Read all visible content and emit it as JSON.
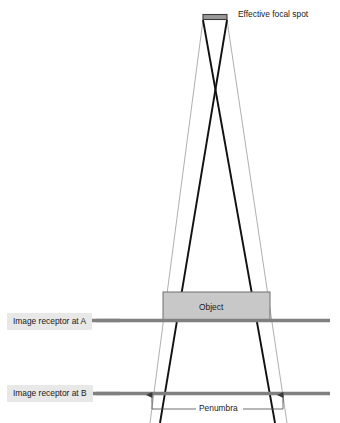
{
  "figure": {
    "labels": {
      "focal_spot": "Effective focal spot",
      "object": "Object",
      "penumbra": "Penumbra",
      "receptor_a": "Image receptor at A",
      "receptor_b": "Image receptor at B"
    },
    "colors": {
      "background": "#ffffff",
      "beam_outer": "#111111",
      "beam_inner": "#9a9a9a",
      "receptor_line": "#808080",
      "object_fill": "#c8c8c8",
      "object_stroke": "#6e6e6e",
      "focal_spot_fill": "#9a9a9a",
      "focal_spot_stroke": "#3a3a3a",
      "label_box": "#e8e8e8",
      "text": "#1a1a1a",
      "annotation": "#4a4a4a"
    },
    "geometry": {
      "focal_spot": {
        "x1": 203,
        "x2": 227,
        "y": 15,
        "height": 5
      },
      "beams": [
        {
          "name": "outer-left",
          "x1": 227,
          "y1": 20,
          "x2": 160,
          "y2": 423,
          "weight": 1.9,
          "color": "#111111"
        },
        {
          "name": "outer-right",
          "x1": 203,
          "y1": 20,
          "x2": 275,
          "y2": 423,
          "weight": 1.9,
          "color": "#111111"
        },
        {
          "name": "inner-left",
          "x1": 203,
          "y1": 20,
          "x2": 150,
          "y2": 423,
          "weight": 0.8,
          "color": "#9a9a9a"
        },
        {
          "name": "inner-right",
          "x1": 227,
          "y1": 20,
          "x2": 287,
          "y2": 423,
          "weight": 0.8,
          "color": "#9a9a9a"
        }
      ],
      "object": {
        "x": 163,
        "y": 292,
        "width": 107,
        "height": 28
      },
      "receptor_a": {
        "x1": 20,
        "x2": 330,
        "y": 320,
        "thickness": 3.4
      },
      "receptor_b": {
        "x1": 20,
        "x2": 330,
        "y": 393,
        "thickness": 3.4
      },
      "penumbra_markers": {
        "left_x": 152,
        "right_x": 283,
        "arrow_y": 396,
        "bracket_y": 409
      }
    }
  }
}
